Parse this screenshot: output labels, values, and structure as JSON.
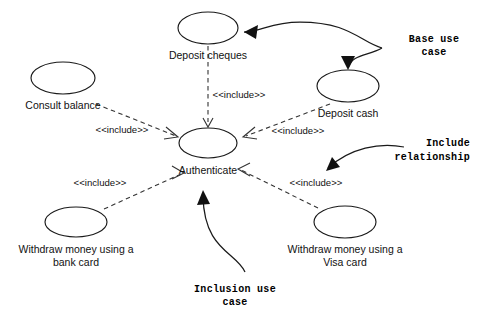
{
  "diagram": {
    "kind": "uml-use-case-diagram",
    "background_color": "#ffffff",
    "stroke_color": "#1a1a1a",
    "dashed_stroke_color": "#333333",
    "use_cases": [
      {
        "id": "deposit-cheques",
        "label": "Deposit cheques",
        "cx": 208,
        "cy": 28,
        "rx": 30,
        "ry": 16,
        "label_x": 208,
        "label_y": 59
      },
      {
        "id": "deposit-cash",
        "label": "Deposit cash",
        "cx": 348,
        "cy": 86,
        "rx": 31,
        "ry": 16,
        "label_x": 348,
        "label_y": 117
      },
      {
        "id": "consult-balance",
        "label": "Consult balance",
        "cx": 63,
        "cy": 78,
        "rx": 32,
        "ry": 16,
        "label_x": 63,
        "label_y": 109
      },
      {
        "id": "authenticate",
        "label": "Authenticate",
        "cx": 208,
        "cy": 143,
        "rx": 29,
        "ry": 15,
        "label_x": 208,
        "label_y": 174
      },
      {
        "id": "withdraw-bank-card",
        "label": "Withdraw money using a",
        "label_line2": "bank card",
        "cx": 76,
        "cy": 222,
        "rx": 31,
        "ry": 15,
        "label_x": 76,
        "label_y": 253,
        "label2_x": 76,
        "label2_y": 266
      },
      {
        "id": "withdraw-visa-card",
        "label": "Withdraw money using a",
        "label_line2": "Visa card",
        "cx": 345,
        "cy": 222,
        "rx": 31,
        "ry": 16,
        "label_x": 345,
        "label_y": 253,
        "label2_x": 345,
        "label2_y": 266
      }
    ],
    "include_relationships": [
      {
        "id": "include-deposit-cheques",
        "from": "deposit-cheques",
        "to": "authenticate",
        "label": "<<include>>",
        "label_x": 239,
        "label_y": 98,
        "path": "M 208,46 L 208,122",
        "head": "M 208,128 L 204,119 L 212,119 Z",
        "head_style": "open",
        "head_path": "M 203,118 L 208,127 L 213,118"
      },
      {
        "id": "include-consult-balance",
        "from": "consult-balance",
        "to": "authenticate",
        "label": "<<include>>",
        "label_x": 122,
        "label_y": 133,
        "path": "M 96,104 L 176,136",
        "head_path": "M 166,127 L 178,137 L 164,139"
      },
      {
        "id": "include-deposit-cash",
        "from": "deposit-cash",
        "to": "authenticate",
        "label": "<<include>>",
        "label_x": 298,
        "label_y": 134,
        "path": "M 330,104 L 246,136",
        "head_path": "M 255,127 L 243,137 L 257,139"
      },
      {
        "id": "include-withdraw-bank-card",
        "from": "withdraw-bank-card",
        "to": "authenticate",
        "label": "<<include>>",
        "label_x": 100,
        "label_y": 186,
        "path": "M 104,209 L 181,174",
        "head_path": "M 172,166 L 184,173 L 172,179"
      },
      {
        "id": "include-withdraw-visa-card",
        "from": "withdraw-visa-card",
        "to": "authenticate",
        "label": "<<include>>",
        "label_x": 316,
        "label_y": 186,
        "path": "M 318,208 L 241,170",
        "head_path": "M 250,163 L 238,169 L 250,176"
      }
    ],
    "annotations": [
      {
        "id": "base-use-case",
        "line1": "Base use",
        "line2": "case",
        "line1_x": 434,
        "line1_y": 42,
        "line2_x": 434,
        "line2_y": 55,
        "text_anchor": "middle",
        "curve": "M 382,48 C 360,42 350,22 300,22 C 270,22 262,32 244,32",
        "branch": "M 382,48 C 368,56 352,54 348,68",
        "arrow_head_1": "M 244,32 L 258,25 L 256,39 Z",
        "arrow_head_2": "M 348,70 L 341,56 L 355,56 Z"
      },
      {
        "id": "include-relationship",
        "line1": "Include",
        "line2": "relationship",
        "line1_x": 470,
        "line1_y": 146,
        "line2_x": 470,
        "line2_y": 160,
        "text_anchor": "end",
        "curve": "M 404,147 C 380,142 350,148 328,168",
        "arrow_head_1": "M 326,171 L 332,157 L 340,167 Z"
      },
      {
        "id": "inclusion-use-case",
        "line1": "Inclusion use",
        "line2": "case",
        "line1_x": 235,
        "line1_y": 292,
        "line2_x": 235,
        "line2_y": 305,
        "text_anchor": "middle",
        "curve": "M 245,272 C 236,252 204,250 203,196",
        "arrow_head_1": "M 203,190 L 197,205 L 210,204 Z"
      }
    ]
  }
}
